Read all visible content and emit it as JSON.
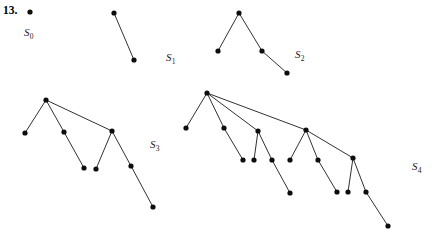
{
  "figure": {
    "problem_number": "13.",
    "canvas": {
      "width": 436,
      "height": 240,
      "background": "#ffffff"
    },
    "style": {
      "node_color": "#0d0d0d",
      "node_radius": 2.6,
      "edge_color": "#1a1a1a",
      "edge_width": 0.9,
      "label_color": "#1a1a1a"
    },
    "trees": [
      {
        "id": "S0",
        "label_text": "S",
        "label_subscript": "0",
        "label_x": 24,
        "label_y": 26,
        "node_count": 1,
        "nodes": [
          {
            "id": "n0",
            "x": 30,
            "y": 12
          }
        ],
        "edges": []
      },
      {
        "id": "S1",
        "label_text": "S",
        "label_subscript": "1",
        "label_x": 166,
        "label_y": 51,
        "node_count": 2,
        "nodes": [
          {
            "id": "n0",
            "x": 114,
            "y": 13
          },
          {
            "id": "n1",
            "x": 134,
            "y": 60
          }
        ],
        "edges": [
          {
            "from": "n0",
            "to": "n1"
          }
        ]
      },
      {
        "id": "S2",
        "label_text": "S",
        "label_subscript": "2",
        "label_x": 295,
        "label_y": 48,
        "node_count": 4,
        "nodes": [
          {
            "id": "n0",
            "x": 239,
            "y": 13
          },
          {
            "id": "n1",
            "x": 218,
            "y": 51
          },
          {
            "id": "n2",
            "x": 262,
            "y": 51
          },
          {
            "id": "n3",
            "x": 287,
            "y": 73
          }
        ],
        "edges": [
          {
            "from": "n0",
            "to": "n1"
          },
          {
            "from": "n0",
            "to": "n2"
          },
          {
            "from": "n2",
            "to": "n3"
          }
        ]
      },
      {
        "id": "S3",
        "label_text": "S",
        "label_subscript": "3",
        "label_x": 150,
        "label_y": 138,
        "node_count": 8,
        "nodes": [
          {
            "id": "n0",
            "x": 46,
            "y": 100
          },
          {
            "id": "n1",
            "x": 25,
            "y": 133
          },
          {
            "id": "n2",
            "x": 64,
            "y": 132
          },
          {
            "id": "n3",
            "x": 84,
            "y": 168
          },
          {
            "id": "n4",
            "x": 112,
            "y": 131
          },
          {
            "id": "n5",
            "x": 96,
            "y": 169
          },
          {
            "id": "n6",
            "x": 131,
            "y": 166
          },
          {
            "id": "n7",
            "x": 153,
            "y": 207
          }
        ],
        "edges": [
          {
            "from": "n0",
            "to": "n1"
          },
          {
            "from": "n0",
            "to": "n2"
          },
          {
            "from": "n0",
            "to": "n4"
          },
          {
            "from": "n2",
            "to": "n3"
          },
          {
            "from": "n4",
            "to": "n5"
          },
          {
            "from": "n4",
            "to": "n6"
          },
          {
            "from": "n6",
            "to": "n7"
          }
        ]
      },
      {
        "id": "S4",
        "label_text": "S",
        "label_subscript": "4",
        "label_x": 412,
        "label_y": 160,
        "node_count": 16,
        "nodes": [
          {
            "id": "n0",
            "x": 207,
            "y": 93
          },
          {
            "id": "n1",
            "x": 186,
            "y": 128
          },
          {
            "id": "n2",
            "x": 224,
            "y": 128
          },
          {
            "id": "n3",
            "x": 243,
            "y": 160
          },
          {
            "id": "n4",
            "x": 258,
            "y": 131
          },
          {
            "id": "n5",
            "x": 254,
            "y": 160
          },
          {
            "id": "n6",
            "x": 272,
            "y": 160
          },
          {
            "id": "n7",
            "x": 290,
            "y": 193
          },
          {
            "id": "n8",
            "x": 306,
            "y": 130
          },
          {
            "id": "n9",
            "x": 290,
            "y": 160
          },
          {
            "id": "n10",
            "x": 318,
            "y": 160
          },
          {
            "id": "n11",
            "x": 337,
            "y": 192
          },
          {
            "id": "n12",
            "x": 353,
            "y": 158
          },
          {
            "id": "n13",
            "x": 348,
            "y": 192
          },
          {
            "id": "n14",
            "x": 366,
            "y": 192
          },
          {
            "id": "n15",
            "x": 388,
            "y": 226
          }
        ],
        "edges": [
          {
            "from": "n0",
            "to": "n1"
          },
          {
            "from": "n0",
            "to": "n2"
          },
          {
            "from": "n0",
            "to": "n4"
          },
          {
            "from": "n0",
            "to": "n8"
          },
          {
            "from": "n2",
            "to": "n3"
          },
          {
            "from": "n4",
            "to": "n5"
          },
          {
            "from": "n4",
            "to": "n6"
          },
          {
            "from": "n6",
            "to": "n7"
          },
          {
            "from": "n8",
            "to": "n9"
          },
          {
            "from": "n8",
            "to": "n10"
          },
          {
            "from": "n8",
            "to": "n12"
          },
          {
            "from": "n10",
            "to": "n11"
          },
          {
            "from": "n12",
            "to": "n13"
          },
          {
            "from": "n12",
            "to": "n14"
          },
          {
            "from": "n14",
            "to": "n15"
          }
        ]
      }
    ]
  }
}
